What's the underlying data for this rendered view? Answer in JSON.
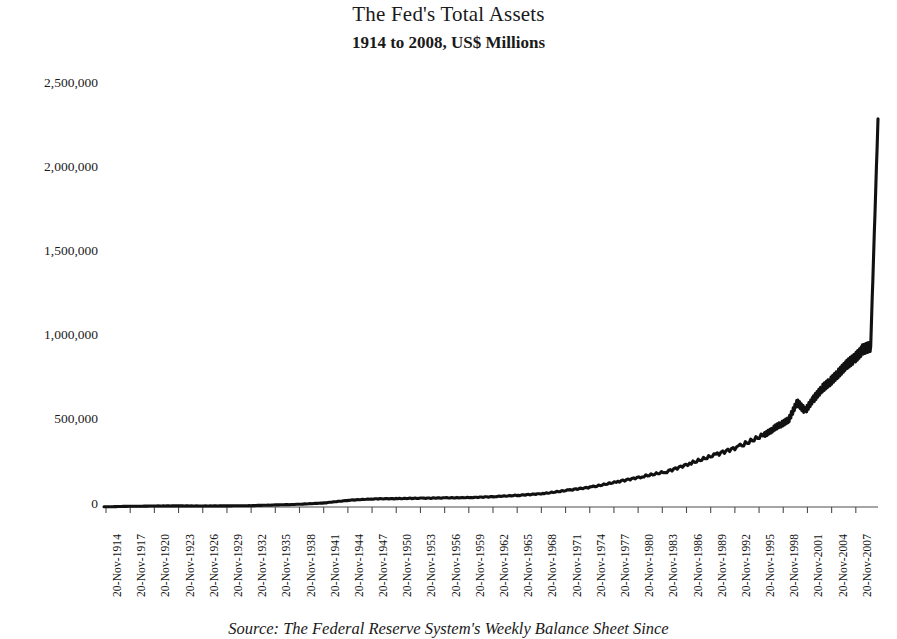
{
  "title": "The Fed's Total Assets",
  "subtitle": "1914 to 2008, US$ Millions",
  "caption": "Source: The Federal Reserve System's Weekly Balance Sheet Since",
  "chart_data": {
    "type": "line",
    "title": "The Fed's Total Assets",
    "subtitle": "1914 to 2008, US$ Millions",
    "xlabel": "",
    "ylabel": "",
    "ylim": [
      0,
      2500000
    ],
    "grid": false,
    "legend": "none",
    "line_color": "#111111",
    "axis_color": "#555555",
    "ytick_labels": [
      "2,500,000",
      "2,000,000",
      "1,500,000",
      "1,000,000",
      "500,000",
      "0"
    ],
    "ytick_values": [
      2500000,
      2000000,
      1500000,
      1000000,
      500000,
      0
    ],
    "xtick_labels": [
      "20-Nov-1914",
      "20-Nov-1917",
      "20-Nov-1920",
      "20-Nov-1923",
      "20-Nov-1926",
      "20-Nov-1929",
      "20-Nov-1932",
      "20-Nov-1935",
      "20-Nov-1938",
      "20-Nov-1941",
      "20-Nov-1944",
      "20-Nov-1947",
      "20-Nov-1950",
      "20-Nov-1953",
      "20-Nov-1956",
      "20-Nov-1959",
      "20-Nov-1962",
      "20-Nov-1965",
      "20-Nov-1968",
      "20-Nov-1971",
      "20-Nov-1974",
      "20-Nov-1977",
      "20-Nov-1980",
      "20-Nov-1983",
      "20-Nov-1986",
      "20-Nov-1989",
      "20-Nov-1992",
      "20-Nov-1995",
      "20-Nov-1998",
      "20-Nov-2001",
      "20-Nov-2004",
      "20-Nov-2007"
    ],
    "x": [
      1914,
      1917,
      1920,
      1923,
      1926,
      1929,
      1932,
      1935,
      1938,
      1941,
      1944,
      1947,
      1950,
      1953,
      1956,
      1959,
      1962,
      1965,
      1968,
      1971,
      1974,
      1977,
      1980,
      1983,
      1986,
      1989,
      1992,
      1995,
      1996,
      1997,
      1998,
      1999,
      2000,
      2001,
      2002,
      2003,
      2004,
      2005,
      2006,
      2007,
      2008,
      2008.9
    ],
    "values": [
      1000,
      4000,
      6000,
      6500,
      6000,
      6500,
      8000,
      12000,
      16000,
      24000,
      40000,
      48000,
      50000,
      52000,
      54000,
      56000,
      62000,
      70000,
      80000,
      100000,
      120000,
      150000,
      180000,
      210000,
      260000,
      310000,
      360000,
      430000,
      460000,
      490000,
      520000,
      620000,
      570000,
      640000,
      700000,
      740000,
      790000,
      840000,
      880000,
      930000,
      950000,
      2300000
    ],
    "series": [
      {
        "name": "Fed Total Assets",
        "values": [
          1000,
          4000,
          6000,
          6500,
          6000,
          6500,
          8000,
          12000,
          16000,
          24000,
          40000,
          48000,
          50000,
          52000,
          54000,
          56000,
          62000,
          70000,
          80000,
          100000,
          120000,
          150000,
          180000,
          210000,
          260000,
          310000,
          360000,
          430000,
          460000,
          490000,
          520000,
          620000,
          570000,
          640000,
          700000,
          740000,
          790000,
          840000,
          880000,
          930000,
          950000,
          2300000
        ]
      }
    ],
    "annotations": [
      {
        "label": "WWII buildup plateau",
        "x": 1945,
        "y": 45000
      },
      {
        "label": "Y2K liquidity spike",
        "x": 1999,
        "y": 620000
      },
      {
        "label": "9/11 liquidity spike",
        "x": 2001,
        "y": 640000
      },
      {
        "label": "2008 crisis vertical surge",
        "x": 2008,
        "y": 2300000
      }
    ],
    "peak_value": 2300000,
    "start_value": 1000
  }
}
